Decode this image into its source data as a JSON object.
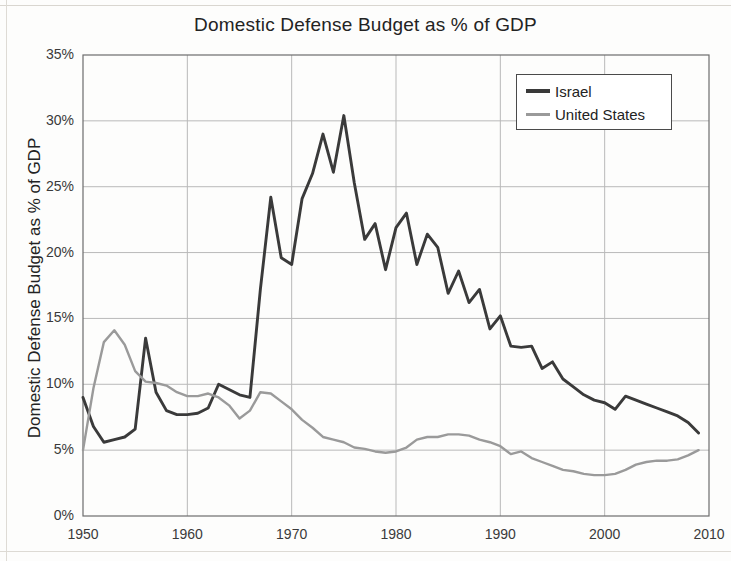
{
  "chart_data": {
    "type": "line",
    "title": "Domestic Defense Budget as % of GDP",
    "xlabel": "",
    "ylabel": "Domestic Defense Budget as % of GDP",
    "xlim": [
      1950,
      2010
    ],
    "ylim": [
      0,
      35
    ],
    "xticks": [
      1950,
      1960,
      1970,
      1980,
      1990,
      2000,
      2010
    ],
    "xtick_labels": [
      "1950",
      "1960",
      "1970",
      "1980",
      "1990",
      "2000",
      "2010"
    ],
    "yticks": [
      0,
      5,
      10,
      15,
      20,
      25,
      30,
      35
    ],
    "ytick_labels": [
      "0%",
      "5%",
      "10%",
      "15%",
      "20%",
      "25%",
      "30%",
      "35%"
    ],
    "grid": true,
    "legend_position": "top-right",
    "x": [
      1950,
      1951,
      1952,
      1953,
      1954,
      1955,
      1956,
      1957,
      1958,
      1959,
      1960,
      1961,
      1962,
      1963,
      1964,
      1965,
      1966,
      1967,
      1968,
      1969,
      1970,
      1971,
      1972,
      1973,
      1974,
      1975,
      1976,
      1977,
      1978,
      1979,
      1980,
      1981,
      1982,
      1983,
      1984,
      1985,
      1986,
      1987,
      1988,
      1989,
      1990,
      1991,
      1992,
      1993,
      1994,
      1995,
      1996,
      1997,
      1998,
      1999,
      2000,
      2001,
      2002,
      2003,
      2004,
      2005,
      2006,
      2007,
      2008,
      2009
    ],
    "series": [
      {
        "name": "Israel",
        "color": "#3a3a3a",
        "values": [
          9.0,
          6.8,
          5.6,
          5.8,
          6.0,
          6.6,
          13.5,
          9.4,
          8.0,
          7.7,
          7.7,
          7.8,
          8.2,
          10.0,
          9.6,
          9.2,
          9.0,
          17.2,
          24.2,
          19.6,
          19.1,
          24.1,
          26.0,
          29.0,
          26.1,
          30.4,
          25.3,
          21.0,
          22.2,
          18.7,
          21.9,
          23.0,
          19.1,
          21.4,
          20.4,
          16.9,
          18.6,
          16.2,
          17.2,
          14.2,
          15.2,
          12.9,
          12.8,
          12.9,
          11.2,
          11.7,
          10.4,
          9.8,
          9.2,
          8.8,
          8.6,
          8.1,
          9.1,
          8.8,
          8.5,
          8.2,
          7.9,
          7.6,
          7.1,
          6.3
        ]
      },
      {
        "name": "United States",
        "color": "#9a9a9a",
        "values": [
          5.0,
          9.7,
          13.2,
          14.1,
          13.0,
          11.0,
          10.2,
          10.1,
          9.9,
          9.4,
          9.1,
          9.1,
          9.3,
          9.0,
          8.4,
          7.4,
          8.0,
          9.4,
          9.3,
          8.7,
          8.1,
          7.3,
          6.7,
          6.0,
          5.8,
          5.6,
          5.2,
          5.1,
          4.9,
          4.8,
          4.9,
          5.2,
          5.8,
          6.0,
          6.0,
          6.2,
          6.2,
          6.1,
          5.8,
          5.6,
          5.3,
          4.7,
          4.9,
          4.4,
          4.1,
          3.8,
          3.5,
          3.4,
          3.2,
          3.1,
          3.1,
          3.2,
          3.5,
          3.9,
          4.1,
          4.2,
          4.2,
          4.3,
          4.6,
          5.0
        ]
      }
    ]
  },
  "legend": {
    "entries": [
      {
        "label": "Israel"
      },
      {
        "label": "United States"
      }
    ]
  }
}
